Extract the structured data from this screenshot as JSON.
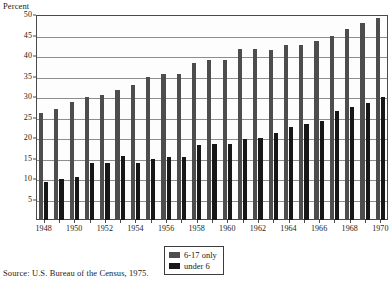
{
  "figure": {
    "y_axis_caption": "Percent",
    "source_note": "Source: U.S. Bureau of the Census, 1975."
  },
  "legend": {
    "items": [
      {
        "label": "6-17 only",
        "color": "#4d4d4d"
      },
      {
        "label": "under 6",
        "color": "#171717"
      }
    ]
  },
  "chart_data": {
    "type": "bar",
    "title": "",
    "subtitle": "",
    "xlabel": "",
    "ylabel": "Percent",
    "ylim": [
      0,
      50
    ],
    "ytick_step": 5,
    "ytick_labels": [
      "50",
      "45",
      "40",
      "35",
      "30",
      "25",
      "20",
      "15",
      "10",
      "5"
    ],
    "ytick_values": [
      50,
      45,
      40,
      35,
      30,
      25,
      20,
      15,
      10,
      5
    ],
    "grid": true,
    "grid_axis": "y",
    "legend_position": "bottom-center",
    "bar_mode": "grouped",
    "categories": [
      "1948",
      "1949",
      "1950",
      "1951",
      "1952",
      "1953",
      "1954",
      "1955",
      "1956",
      "1957",
      "1958",
      "1959",
      "1960",
      "1961",
      "1962",
      "1963",
      "1964",
      "1965",
      "1966",
      "1967",
      "1968",
      "1969",
      "1970"
    ],
    "xtick_labels": [
      "1948",
      "1950",
      "1952",
      "1954",
      "1956",
      "1958",
      "1960",
      "1962",
      "1964",
      "1966",
      "1968",
      "1970"
    ],
    "series": [
      {
        "name": "6-17 only",
        "color": "#4d4d4d",
        "values": [
          26.0,
          27.0,
          28.9,
          30.0,
          30.5,
          31.7,
          33.0,
          35.0,
          35.7,
          35.7,
          38.3,
          39.0,
          39.0,
          41.6,
          41.8,
          41.5,
          42.7,
          42.7,
          43.7,
          45.0,
          46.7,
          48.0,
          49.2
        ]
      },
      {
        "name": "under 6",
        "color": "#171717",
        "values": [
          9.2,
          10.0,
          10.5,
          14.0,
          14.0,
          15.5,
          14.0,
          14.8,
          15.4,
          15.4,
          18.2,
          18.6,
          18.6,
          19.8,
          20.0,
          21.2,
          22.7,
          23.3,
          24.2,
          26.5,
          27.6,
          28.5,
          30.0
        ]
      }
    ]
  }
}
